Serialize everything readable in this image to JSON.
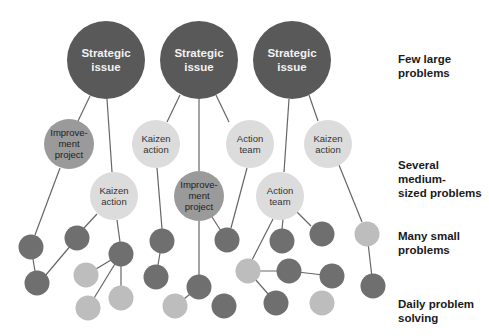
{
  "colors": {
    "strategic": "#595959",
    "medium_dark": "#9a9a9a",
    "medium_light": "#dcdcdc",
    "small_dark": "#6f6f6f",
    "small_light": "#bdbdbd",
    "line": "#666666"
  },
  "levels": [
    {
      "line1": "Few large",
      "line2": "problems"
    },
    {
      "line1": "Several medium-",
      "line2": "sized problems"
    },
    {
      "line1": "Many small",
      "line2": "problems"
    },
    {
      "line1": "Daily problem",
      "line2": "solving"
    }
  ],
  "nodes": {
    "strategic": [
      {
        "line1": "Strategic",
        "line2": "issue"
      },
      {
        "line1": "Strategic",
        "line2": "issue"
      },
      {
        "line1": "Strategic",
        "line2": "issue"
      }
    ],
    "medium": [
      {
        "line1": "Improve-",
        "line2": "ment",
        "line3": "project"
      },
      {
        "line1": "Kaizen",
        "line2": "action"
      },
      {
        "line1": "Action",
        "line2": "team"
      },
      {
        "line1": "Kaizen",
        "line2": "action"
      },
      {
        "line1": "Kaizen",
        "line2": "action"
      },
      {
        "line1": "Improve-",
        "line2": "ment",
        "line3": "project"
      },
      {
        "line1": "Action",
        "line2": "team"
      }
    ]
  }
}
